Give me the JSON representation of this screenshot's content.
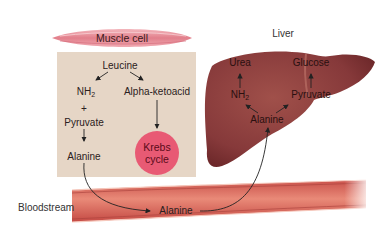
{
  "muscle": {
    "title": "Muscle cell",
    "leucine": "Leucine",
    "nh2": "NH",
    "nh2_sub": "2",
    "alpha_ketoacid": "Alpha-ketoacid",
    "plus": "+",
    "pyruvate": "Pyruvate",
    "alanine": "Alanine",
    "krebs_line1": "Krebs",
    "krebs_line2": "cycle"
  },
  "liver": {
    "title": "Liver",
    "urea": "Urea",
    "glucose": "Glucose",
    "nh2": "NH",
    "nh2_sub": "2",
    "pyruvate": "Pyruvate",
    "alanine": "Alanine"
  },
  "blood": {
    "label": "Bloodstream",
    "alanine": "Alanine"
  },
  "colors": {
    "muscle_box": "#e6d6c6",
    "krebs": "#e85a74",
    "liver": "#8a3a36",
    "vessel": "#d9705e",
    "muscle_fiber": "#e8909a"
  }
}
